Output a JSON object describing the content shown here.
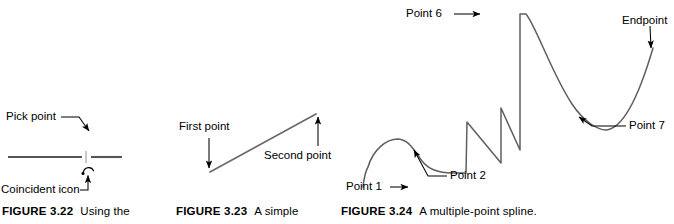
{
  "page": {
    "background_color": "#ffffff",
    "ink_color": "#000000",
    "line_color": "#555555"
  },
  "figures": [
    {
      "id": "figure-3-22",
      "caption_label": "FIGURE 3.22",
      "caption_text": "Using the",
      "labels": [
        {
          "name": "pick-point",
          "text": "Pick point"
        },
        {
          "name": "coincident-icon",
          "text": "Coincident icon"
        }
      ],
      "graphic": {
        "kind": "horizontal-line-with-pick-marker",
        "description": "A horizontal line with a small gap and a coincident-constraint icon below it"
      }
    },
    {
      "id": "figure-3-23",
      "caption_label": "FIGURE 3.23",
      "caption_text": "A simple",
      "labels": [
        {
          "name": "first-point",
          "text": "First point"
        },
        {
          "name": "second-point",
          "text": "Second point"
        }
      ],
      "graphic": {
        "kind": "diagonal-line",
        "description": "A single straight line rising from lower-left to upper-right"
      }
    },
    {
      "id": "figure-3-24",
      "caption_label": "FIGURE 3.24",
      "caption_text": "A multiple-point spline.",
      "labels": [
        {
          "name": "point-1",
          "text": "Point 1"
        },
        {
          "name": "point-2",
          "text": "Point 2"
        },
        {
          "name": "point-6",
          "text": "Point 6"
        },
        {
          "name": "point-7",
          "text": "Point 7"
        },
        {
          "name": "endpoint",
          "text": "Endpoint"
        }
      ],
      "graphic": {
        "kind": "multiple-point-spline",
        "description": "A winding spline curve passing through seven points and an endpoint"
      }
    }
  ]
}
